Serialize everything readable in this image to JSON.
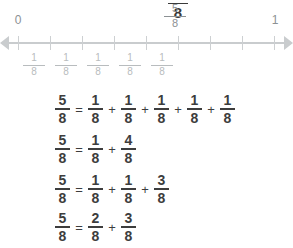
{
  "title_clipped": {
    "numerator": "5",
    "denominator": "8"
  },
  "number_line": {
    "start_label": "0",
    "end_label": "1",
    "marker": {
      "numerator": "5",
      "denominator": "8",
      "label": "5/8"
    },
    "tick_count": 9,
    "unit_fractions": [
      {
        "numerator": "1",
        "denominator": "8"
      },
      {
        "numerator": "1",
        "denominator": "8"
      },
      {
        "numerator": "1",
        "denominator": "8"
      },
      {
        "numerator": "1",
        "denominator": "8"
      },
      {
        "numerator": "1",
        "denominator": "8"
      }
    ],
    "line_color": "#c9ccce",
    "label_color": "#8c9194"
  },
  "equations": [
    {
      "id": "equation-1",
      "text": "5/8 = 1/8 + 1/8 + 1/8 + 1/8 + 1/8",
      "tokens": [
        {
          "kind": "fraction",
          "numerator": "5",
          "denominator": "8"
        },
        {
          "kind": "operator",
          "symbol": "="
        },
        {
          "kind": "fraction",
          "numerator": "1",
          "denominator": "8"
        },
        {
          "kind": "operator",
          "symbol": "+"
        },
        {
          "kind": "fraction",
          "numerator": "1",
          "denominator": "8"
        },
        {
          "kind": "operator",
          "symbol": "+"
        },
        {
          "kind": "fraction",
          "numerator": "1",
          "denominator": "8"
        },
        {
          "kind": "operator",
          "symbol": "+"
        },
        {
          "kind": "fraction",
          "numerator": "1",
          "denominator": "8"
        },
        {
          "kind": "operator",
          "symbol": "+"
        },
        {
          "kind": "fraction",
          "numerator": "1",
          "denominator": "8"
        }
      ]
    },
    {
      "id": "equation-2",
      "text": "5/8 = 1/8 + 4/8",
      "tokens": [
        {
          "kind": "fraction",
          "numerator": "5",
          "denominator": "8"
        },
        {
          "kind": "operator",
          "symbol": "="
        },
        {
          "kind": "fraction",
          "numerator": "1",
          "denominator": "8"
        },
        {
          "kind": "operator",
          "symbol": "+"
        },
        {
          "kind": "fraction",
          "numerator": "4",
          "denominator": "8"
        }
      ]
    },
    {
      "id": "equation-3",
      "text": "5/8 = 1/8 + 1/8 + 3/8",
      "tokens": [
        {
          "kind": "fraction",
          "numerator": "5",
          "denominator": "8"
        },
        {
          "kind": "operator",
          "symbol": "="
        },
        {
          "kind": "fraction",
          "numerator": "1",
          "denominator": "8"
        },
        {
          "kind": "operator",
          "symbol": "+"
        },
        {
          "kind": "fraction",
          "numerator": "1",
          "denominator": "8"
        },
        {
          "kind": "operator",
          "symbol": "+"
        },
        {
          "kind": "fraction",
          "numerator": "3",
          "denominator": "8"
        }
      ]
    },
    {
      "id": "equation-4",
      "text": "5/8 = 2/8 + 3/8",
      "tokens": [
        {
          "kind": "fraction",
          "numerator": "5",
          "denominator": "8"
        },
        {
          "kind": "operator",
          "symbol": "="
        },
        {
          "kind": "fraction",
          "numerator": "2",
          "denominator": "8"
        },
        {
          "kind": "operator",
          "symbol": "+"
        },
        {
          "kind": "fraction",
          "numerator": "3",
          "denominator": "8"
        }
      ]
    }
  ]
}
